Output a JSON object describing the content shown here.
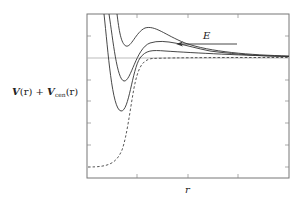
{
  "figure": {
    "type": "effective-potential-diagram",
    "y_axis_label": {
      "V": "V",
      "r1": "(r)",
      "plus": " + ",
      "Vcen": "V",
      "sub": "cen",
      "r2": "(r)"
    },
    "x_axis_label": "r",
    "energy_label": "E",
    "colors": {
      "frame": "#777777",
      "curve": "#333333",
      "dashed": "#444444",
      "reference_line": "#999999",
      "text": "#222222"
    },
    "curves": [
      {
        "name": "effective-potential-low-l",
        "style": "solid",
        "description": "shallowest well at top"
      },
      {
        "name": "effective-potential-mid-l",
        "style": "solid"
      },
      {
        "name": "effective-potential-high-depth",
        "style": "solid",
        "description": "deepest well"
      },
      {
        "name": "bare-potential",
        "style": "dashed",
        "description": "V(r) without centrifugal term"
      }
    ],
    "reference_line": "zero-energy asymptote",
    "arrow": "incoming-particle-energy-arrow pointing left"
  }
}
